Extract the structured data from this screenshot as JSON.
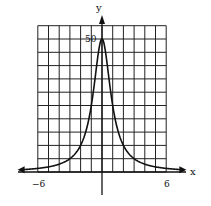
{
  "chart_data": {
    "type": "line",
    "title": "",
    "xlabel": "x",
    "ylabel": "y",
    "xlim": [
      -6,
      6
    ],
    "ylim": [
      0,
      55
    ],
    "x_step": 1,
    "y_step": 5,
    "grid": true,
    "x_tick_labels": [
      {
        "value": -6,
        "label": "-6"
      },
      {
        "value": 6,
        "label": "6"
      }
    ],
    "y_tick_labels": [
      {
        "value": 50,
        "label": "50"
      }
    ],
    "series": [
      {
        "name": "curve",
        "formula": "y = 50/(1+x^2)",
        "x": [
          -7,
          -6,
          -5,
          -4,
          -3,
          -2,
          -1.5,
          -1,
          -0.5,
          0,
          0.5,
          1,
          1.5,
          2,
          3,
          4,
          5,
          6,
          7
        ],
        "y": [
          1,
          1.35,
          1.92,
          2.94,
          5,
          10,
          15.4,
          25,
          40,
          50,
          40,
          25,
          15.4,
          10,
          5,
          2.94,
          1.92,
          1.35,
          1
        ]
      }
    ],
    "legend": null
  },
  "labels": {
    "x_axis": "x",
    "y_axis": "y",
    "peak": "50",
    "neg6": "−6",
    "pos6": "6"
  }
}
